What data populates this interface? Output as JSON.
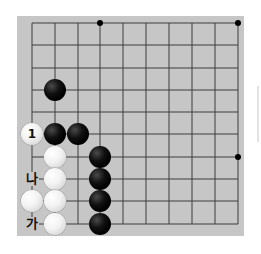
{
  "board": {
    "columns": 10,
    "rows": 10,
    "x_lines": [
      32,
      55,
      78,
      100,
      123,
      146,
      169,
      192,
      215,
      238
    ],
    "y_lines": [
      23,
      45,
      68,
      90,
      112,
      134,
      157,
      179,
      201,
      224
    ],
    "background_color": "#c6c6c6",
    "line_color": "#3c3c3c"
  },
  "star_points": [
    {
      "col": 4,
      "row": 1
    },
    {
      "col": 10,
      "row": 1
    },
    {
      "col": 10,
      "row": 7
    }
  ],
  "stones": [
    {
      "color": "black",
      "col": 2,
      "row": 4,
      "label": ""
    },
    {
      "color": "white",
      "col": 1,
      "row": 6,
      "label": "1"
    },
    {
      "color": "black",
      "col": 2,
      "row": 6,
      "label": ""
    },
    {
      "color": "black",
      "col": 3,
      "row": 6,
      "label": ""
    },
    {
      "color": "white",
      "col": 2,
      "row": 7,
      "label": ""
    },
    {
      "color": "black",
      "col": 4,
      "row": 7,
      "label": ""
    },
    {
      "color": "white",
      "col": 2,
      "row": 8,
      "label": ""
    },
    {
      "color": "black",
      "col": 4,
      "row": 8,
      "label": ""
    },
    {
      "color": "white",
      "col": 1,
      "row": 9,
      "label": ""
    },
    {
      "color": "white",
      "col": 2,
      "row": 9,
      "label": ""
    },
    {
      "color": "black",
      "col": 4,
      "row": 9,
      "label": ""
    },
    {
      "color": "white",
      "col": 2,
      "row": 10,
      "label": ""
    },
    {
      "color": "black",
      "col": 4,
      "row": 10,
      "label": ""
    }
  ],
  "point_labels": [
    {
      "text": "나",
      "col": 1,
      "row": 8
    },
    {
      "text": "가",
      "col": 1,
      "row": 10
    }
  ]
}
